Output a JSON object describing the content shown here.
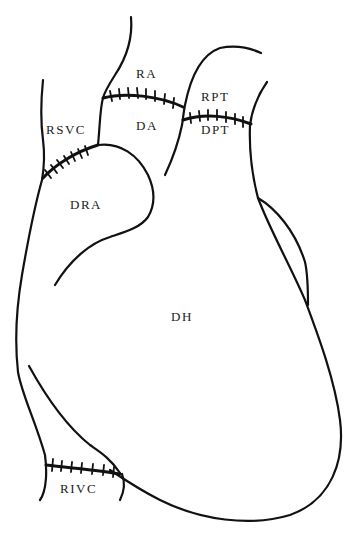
{
  "diagram": {
    "type": "heart-transplant-anastomosis",
    "line_color": "#111111",
    "background": "#ffffff",
    "labels": {
      "ra": "RA",
      "da": "DA",
      "rpt": "RPT",
      "dpt": "DPT",
      "rsvc": "RSVC",
      "dra": "DRA",
      "dh": "DH",
      "rivc": "RIVC"
    }
  }
}
